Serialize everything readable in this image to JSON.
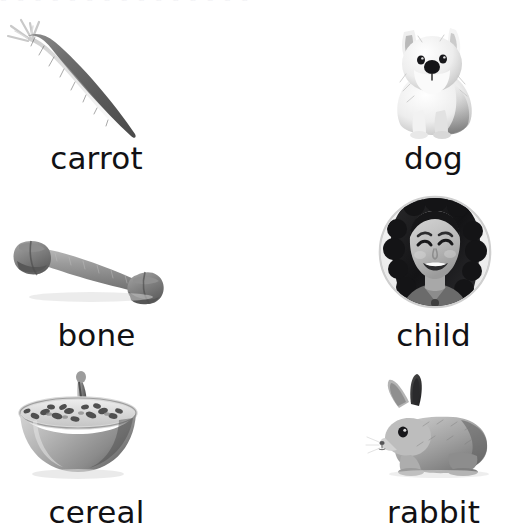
{
  "page": {
    "background_color": "#ffffff",
    "text_color": "#111114",
    "top_cutoff_text": "a a a a a a a a a a a a a a a",
    "columns": 2,
    "rows": 3
  },
  "cards": [
    {
      "label": "carrot",
      "image": "carrot-photo",
      "image_style": "grayscale",
      "row": 0,
      "column": 0
    },
    {
      "label": "dog",
      "image": "dog-photo",
      "image_style": "grayscale",
      "row": 0,
      "column": 1
    },
    {
      "label": "bone",
      "image": "bone-photo",
      "image_style": "grayscale",
      "row": 1,
      "column": 0
    },
    {
      "label": "child",
      "image": "child-photo",
      "image_style": "grayscale-circle",
      "row": 1,
      "column": 1
    },
    {
      "label": "cereal",
      "image": "cereal-photo",
      "image_style": "grayscale",
      "row": 2,
      "column": 0
    },
    {
      "label": "rabbit",
      "image": "rabbit-photo",
      "image_style": "grayscale",
      "row": 2,
      "column": 1
    }
  ]
}
